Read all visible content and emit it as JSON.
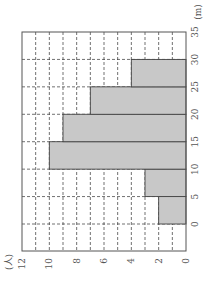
{
  "chart_data": {
    "type": "bar",
    "orientation": "histogram (image rotated 90° counter-clockwise)",
    "title": "",
    "xlabel": "(m)",
    "ylabel": "(人)",
    "bins": [
      [
        0,
        5
      ],
      [
        5,
        10
      ],
      [
        10,
        15
      ],
      [
        15,
        20
      ],
      [
        20,
        25
      ],
      [
        25,
        30
      ]
    ],
    "categories": [
      "0-5",
      "5-10",
      "10-15",
      "15-20",
      "20-25",
      "25-30"
    ],
    "values": [
      2,
      3,
      10,
      9,
      7,
      4
    ],
    "x_ticks": [
      "0",
      "5",
      "10",
      "15",
      "20",
      "25",
      "30",
      "35"
    ],
    "y_ticks": [
      "0",
      "2",
      "4",
      "6",
      "8",
      "10",
      "12"
    ],
    "xlim": [
      0,
      35
    ],
    "ylim": [
      0,
      12
    ],
    "grid": true,
    "grid_style": "dashed",
    "bar_color": "#c8c8c8",
    "legend": null
  },
  "labels": {
    "y_unit": "(人)",
    "x_unit": "(m)"
  }
}
